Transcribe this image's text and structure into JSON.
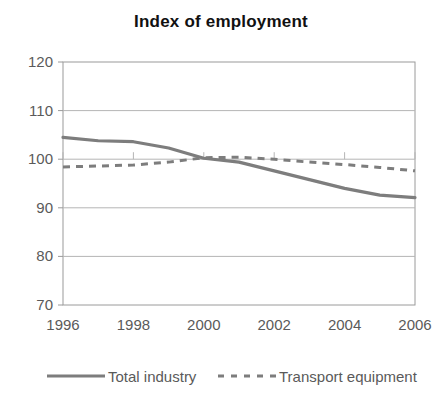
{
  "chart_data": {
    "type": "line",
    "title": "Index of employment",
    "xlabel": "",
    "ylabel": "",
    "xlim": [
      1996,
      2006
    ],
    "ylim": [
      70,
      120
    ],
    "yticks": [
      70,
      80,
      90,
      100,
      110,
      120
    ],
    "xticks": [
      1996,
      1998,
      2000,
      2002,
      2004,
      2006
    ],
    "grid": true,
    "legend_position": "bottom",
    "x": [
      1996,
      1997,
      1998,
      1999,
      2000,
      2001,
      2002,
      2003,
      2004,
      2005,
      2006
    ],
    "series": [
      {
        "name": "Total industry",
        "style": "solid",
        "color": "#7d7d7d",
        "values": [
          104.5,
          103.8,
          103.6,
          102.3,
          100.2,
          99.4,
          97.6,
          95.8,
          94.0,
          92.6,
          92.1
        ]
      },
      {
        "name": "Transport equipment",
        "style": "dashed",
        "color": "#7d7d7d",
        "values": [
          98.4,
          98.6,
          98.8,
          99.4,
          100.3,
          100.4,
          100.0,
          99.4,
          98.9,
          98.3,
          97.6
        ]
      }
    ]
  },
  "axes": {
    "y_tick_labels": [
      "120",
      "110",
      "100",
      "90",
      "80",
      "70"
    ],
    "x_tick_labels": [
      "1996",
      "1998",
      "2000",
      "2002",
      "2004",
      "2006"
    ]
  },
  "legend": {
    "items": [
      {
        "label": "Total industry",
        "style": "solid"
      },
      {
        "label": "Transport equipment",
        "style": "dashed"
      }
    ]
  },
  "colors": {
    "line": "#7d7d7d",
    "axis": "#9a9a9a",
    "grid": "#b5b5b5",
    "text": "#5a5a5a",
    "title": "#111111",
    "background": "#ffffff"
  }
}
